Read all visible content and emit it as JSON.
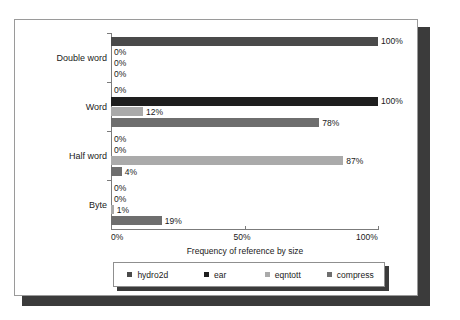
{
  "chart_data": {
    "type": "bar",
    "orientation": "horizontal",
    "title": "",
    "xlabel": "Frequency of reference by size",
    "ylabel": "",
    "xlim": [
      0,
      100
    ],
    "xticks": [
      "0%",
      "50%",
      "100%"
    ],
    "xtick_values": [
      0,
      50,
      100
    ],
    "grid": false,
    "legend_position": "bottom",
    "categories": [
      "Double word",
      "Word",
      "Half word",
      "Byte"
    ],
    "series": [
      {
        "name": "hydro2d",
        "color": "#4a4a4a",
        "values": [
          100,
          0,
          0,
          0
        ],
        "labels": [
          "100%",
          "0%",
          "0%",
          "0%"
        ]
      },
      {
        "name": "ear",
        "color": "#1e1e1e",
        "values": [
          0,
          100,
          0,
          0
        ],
        "labels": [
          "0%",
          "100%",
          "0%",
          "0%"
        ]
      },
      {
        "name": "eqntott",
        "color": "#aaaaaa",
        "values": [
          0,
          12,
          87,
          1
        ],
        "labels": [
          "0%",
          "12%",
          "87%",
          "1%"
        ]
      },
      {
        "name": "compress",
        "color": "#6e6e6e",
        "values": [
          0,
          78,
          4,
          19
        ],
        "labels": [
          "0%",
          "78%",
          "4%",
          "19%"
        ]
      }
    ]
  },
  "legend": {
    "items": [
      {
        "label": "hydro2d"
      },
      {
        "label": "ear"
      },
      {
        "label": "eqntott"
      },
      {
        "label": "compress"
      }
    ]
  },
  "axis": {
    "x_title": "Frequency of reference by size",
    "x_ticks": [
      "0%",
      "50%",
      "100%"
    ]
  }
}
